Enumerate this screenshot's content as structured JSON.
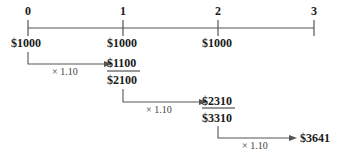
{
  "timeline": {
    "periods": [
      "0",
      "1",
      "2",
      "3"
    ]
  },
  "deposits": [
    "$1000",
    "$1000",
    "$1000"
  ],
  "steps": [
    {
      "multiplier": "× 1.10",
      "result": "$1100",
      "sum": "$2100"
    },
    {
      "multiplier": "× 1.10",
      "result": "$2310",
      "sum": "$3310"
    },
    {
      "multiplier": "× 1.10",
      "result": "$3641"
    }
  ],
  "colors": {
    "line": "#555555",
    "text": "#1a1a1a"
  }
}
